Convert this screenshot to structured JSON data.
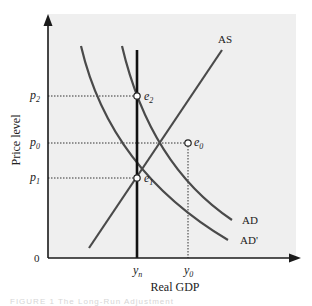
{
  "diagram": {
    "type": "AD-AS model",
    "y_axis_label": "Price level",
    "x_axis_label": "Real GDP",
    "origin_label": "0",
    "price_levels": [
      {
        "id": "p2",
        "base": "p",
        "sub": "2"
      },
      {
        "id": "p0",
        "base": "p",
        "sub": "0"
      },
      {
        "id": "p1",
        "base": "p",
        "sub": "1"
      }
    ],
    "outputs": [
      {
        "id": "yn",
        "base": "y",
        "sub": "n"
      },
      {
        "id": "y0",
        "base": "y",
        "sub": "0"
      }
    ],
    "equilibria": [
      {
        "id": "e2",
        "base": "e",
        "sub": "2"
      },
      {
        "id": "e0",
        "base": "e",
        "sub": "0"
      },
      {
        "id": "e1",
        "base": "e",
        "sub": "1"
      }
    ],
    "curves": {
      "as": "AS",
      "ad": "AD",
      "ad_prime": "AD'"
    },
    "caption": "FIGURE 1  The Long-Run Adjustment"
  },
  "colors": {
    "plot_background": "#efefef",
    "curve": "#4a4a4a",
    "axis": "#1a1a1a"
  }
}
